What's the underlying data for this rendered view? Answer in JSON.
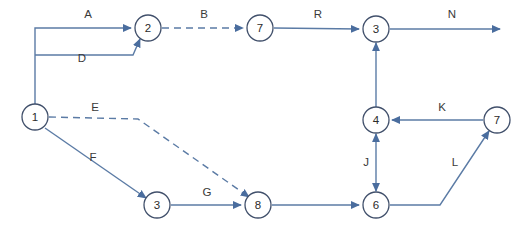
{
  "diagram": {
    "type": "activity-network-diagram",
    "canvas": {
      "width": 518,
      "height": 231
    },
    "colors": {
      "edge": "#5b7ba5",
      "node_stroke": "#41506b",
      "node_fill": "#ffffff",
      "label_text": "#3a3a3a",
      "background": "#ffffff"
    },
    "nodes": [
      {
        "id": "n1",
        "label": "1",
        "cx": 35,
        "cy": 117,
        "r": 13
      },
      {
        "id": "n2",
        "label": "2",
        "cx": 148,
        "cy": 28,
        "r": 13
      },
      {
        "id": "n7top",
        "label": "7",
        "cx": 260,
        "cy": 28,
        "r": 13
      },
      {
        "id": "n3top",
        "label": "3",
        "cx": 376,
        "cy": 29,
        "r": 13
      },
      {
        "id": "n4",
        "label": "4",
        "cx": 376,
        "cy": 120,
        "r": 13
      },
      {
        "id": "n7right",
        "label": "7",
        "cx": 497,
        "cy": 120,
        "r": 13
      },
      {
        "id": "n3bot",
        "label": "3",
        "cx": 157,
        "cy": 205,
        "r": 13
      },
      {
        "id": "n8",
        "label": "8",
        "cx": 258,
        "cy": 205,
        "r": 13
      },
      {
        "id": "n6",
        "label": "6",
        "cx": 376,
        "cy": 205,
        "r": 13
      }
    ],
    "edges": [
      {
        "id": "edge-a",
        "label": "A",
        "from": "n1",
        "to": "n2",
        "style": "solid",
        "arrows": "end",
        "label_x": 88,
        "label_y": 18
      },
      {
        "id": "edge-d",
        "label": "D",
        "from": "n1",
        "to": "n2",
        "style": "solid",
        "arrows": "end",
        "label_x": 82,
        "label_y": 62
      },
      {
        "id": "edge-b",
        "label": "B",
        "from": "n2",
        "to": "n7top",
        "style": "dashed",
        "arrows": "end",
        "label_x": 204,
        "label_y": 18
      },
      {
        "id": "edge-r",
        "label": "R",
        "from": "n7top",
        "to": "n3top",
        "style": "solid",
        "arrows": "end",
        "label_x": 318,
        "label_y": 18
      },
      {
        "id": "edge-n",
        "label": "N",
        "from": "n3top",
        "to": "terminal",
        "style": "solid",
        "arrows": "end",
        "label_x": 452,
        "label_y": 18
      },
      {
        "id": "edge-e",
        "label": "E",
        "from": "n1",
        "to": "n8",
        "style": "dashed",
        "arrows": "end",
        "label_x": 95,
        "label_y": 111
      },
      {
        "id": "edge-f",
        "label": "F",
        "from": "n1",
        "to": "n3bot",
        "style": "solid",
        "arrows": "end",
        "label_x": 93,
        "label_y": 161
      },
      {
        "id": "edge-g",
        "label": "G",
        "from": "n3bot",
        "to": "n8",
        "style": "solid",
        "arrows": "end",
        "label_x": 207,
        "label_y": 196
      },
      {
        "id": "edge-8-6",
        "label": "",
        "from": "n8",
        "to": "n6",
        "style": "solid",
        "arrows": "end",
        "label_x": 0,
        "label_y": 0
      },
      {
        "id": "edge-j",
        "label": "J",
        "from": "n6",
        "to": "n4",
        "style": "solid",
        "arrows": "both",
        "label_x": 366,
        "label_y": 166
      },
      {
        "id": "edge-4-3",
        "label": "",
        "from": "n4",
        "to": "n3top",
        "style": "solid",
        "arrows": "end",
        "label_x": 0,
        "label_y": 0
      },
      {
        "id": "edge-k",
        "label": "K",
        "from": "n7right",
        "to": "n4",
        "style": "solid",
        "arrows": "end",
        "label_x": 442,
        "label_y": 111
      },
      {
        "id": "edge-l",
        "label": "L",
        "from": "n6",
        "to": "n7right",
        "style": "solid",
        "arrows": "end",
        "label_x": 455,
        "label_y": 166
      }
    ]
  }
}
